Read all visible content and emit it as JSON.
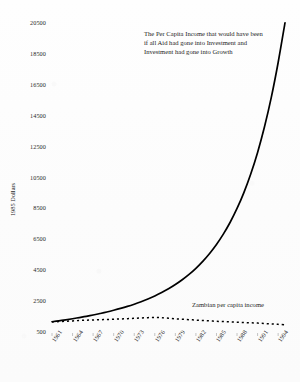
{
  "figure": {
    "background_color": "#fdfdfd",
    "line_color": "#000000",
    "text_color": "#1c1c1c"
  },
  "axis": {
    "y_title": "1985 Dollars"
  },
  "annotations": {
    "counterfactual": "The Per Capita Income that would have been if all Aid had gone into Investment and Investment had gone into Growth",
    "actual": "Zambian per capita income"
  },
  "chart_data": {
    "type": "line",
    "title": "",
    "xlabel": "",
    "ylabel": "1985 Dollars",
    "xlim": [
      1961,
      1995
    ],
    "ylim": [
      500,
      20500
    ],
    "grid": false,
    "legend_position": "inline-annotation",
    "x_tick_labels": [
      "1961",
      "1964",
      "1967",
      "1970",
      "1973",
      "1976",
      "1979",
      "1982",
      "1985",
      "1988",
      "1991",
      "1994"
    ],
    "y_tick_labels": [
      "500",
      "2500",
      "4500",
      "6500",
      "8500",
      "10500",
      "12500",
      "14500",
      "16500",
      "18500",
      "20500"
    ],
    "y_tick_values": [
      500,
      2500,
      4500,
      6500,
      8500,
      10500,
      12500,
      14500,
      16500,
      18500,
      20500
    ],
    "x": [
      1961,
      1962,
      1963,
      1964,
      1965,
      1966,
      1967,
      1968,
      1969,
      1970,
      1971,
      1972,
      1973,
      1974,
      1975,
      1976,
      1977,
      1978,
      1979,
      1980,
      1981,
      1982,
      1983,
      1984,
      1985,
      1986,
      1987,
      1988,
      1989,
      1990,
      1991,
      1992,
      1993,
      1994,
      1995
    ],
    "series": [
      {
        "name": "The Per Capita Income that would have been if all Aid had gone into Investment and Investment had gone into Growth",
        "style": "solid",
        "values": [
          1100,
          1160,
          1225,
          1295,
          1370,
          1450,
          1535,
          1630,
          1730,
          1840,
          1960,
          2090,
          2235,
          2395,
          2570,
          2765,
          2985,
          3230,
          3505,
          3815,
          4165,
          4560,
          5010,
          5520,
          6100,
          6770,
          7540,
          8430,
          9460,
          10660,
          12060,
          13700,
          15620,
          17880,
          20450
        ]
      },
      {
        "name": "Zambian per capita income",
        "style": "dotted",
        "values": [
          1090,
          1110,
          1130,
          1155,
          1180,
          1200,
          1215,
          1230,
          1245,
          1260,
          1280,
          1300,
          1320,
          1345,
          1365,
          1380,
          1360,
          1325,
          1290,
          1265,
          1235,
          1205,
          1180,
          1155,
          1130,
          1110,
          1090,
          1070,
          1050,
          1030,
          1010,
          985,
          960,
          930,
          905
        ]
      }
    ]
  }
}
